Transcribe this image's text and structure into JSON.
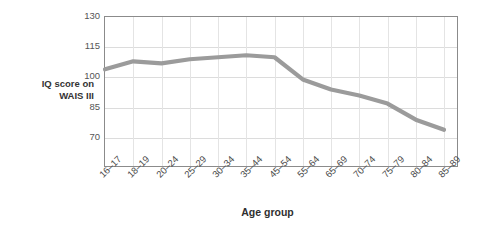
{
  "chart_data": {
    "type": "line",
    "title": "",
    "xlabel": "Age group",
    "ylabel": "IQ score on WAIS III",
    "ylabel_lines": [
      "IQ score on",
      "WAIS III"
    ],
    "categories": [
      "16–17",
      "18–19",
      "20–24",
      "25–29",
      "30–34",
      "35–44",
      "45–54",
      "55–64",
      "65–69",
      "70–74",
      "75–79",
      "80–84",
      "85–89"
    ],
    "values": [
      104,
      108,
      107,
      109,
      110,
      111,
      110,
      99,
      94,
      91,
      87,
      79,
      74
    ],
    "series": [
      {
        "name": "IQ score on WAIS III",
        "values": [
          104,
          108,
          107,
          109,
          110,
          111,
          110,
          99,
          94,
          91,
          87,
          79,
          74
        ]
      }
    ],
    "ylim": [
      55,
      130
    ],
    "yticks": [
      130,
      115,
      100,
      85,
      70
    ],
    "ytick_labels": [
      "130",
      "115",
      "100",
      "85",
      "70"
    ],
    "grid": true,
    "legend": "none",
    "line_color": "#9b9b9b",
    "grid_color": "#dcdcdc",
    "axis_color": "#8b8b8b",
    "background": "#ffffff"
  }
}
